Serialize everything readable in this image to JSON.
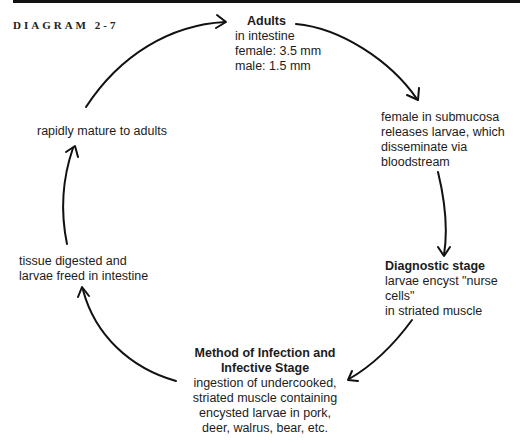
{
  "diagram": {
    "label": "DIAGRAM 2-7",
    "nodes": {
      "adults": {
        "title": "Adults",
        "lines": [
          "in intestine",
          "female: 3.5 mm",
          "male: 1.5 mm"
        ]
      },
      "dissemination": {
        "lines": [
          "female in submucosa",
          "releases larvae, which",
          "disseminate via",
          "bloodstream"
        ]
      },
      "diagnostic": {
        "title": "Diagnostic stage",
        "lines": [
          "larvae encyst \"nurse cells\"",
          "in striated muscle"
        ]
      },
      "infection": {
        "title_lines": [
          "Method of Infection and",
          "Infective Stage"
        ],
        "lines": [
          "ingestion of undercooked,",
          "striated muscle containing",
          "encysted larvae in pork,",
          "deer, walrus, bear, etc."
        ]
      },
      "digestion": {
        "lines": [
          "tissue digested and",
          "larvae freed in intestine"
        ]
      },
      "maturation": {
        "lines": [
          "rapidly mature to adults"
        ]
      }
    },
    "arrow_color": "#111111"
  }
}
